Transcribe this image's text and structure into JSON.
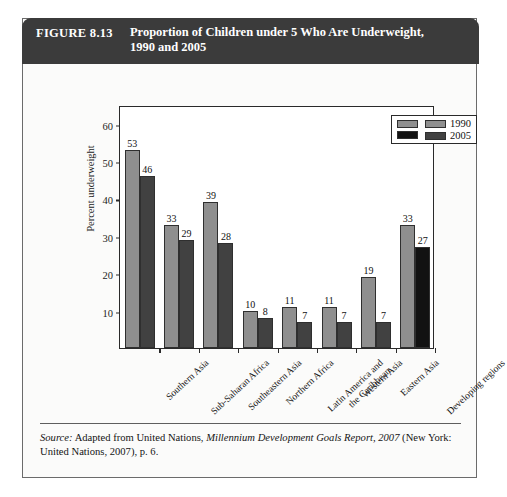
{
  "figure": {
    "number": "FIGURE 8.13",
    "title_line1": "Proportion of Children under 5 Who Are Underweight,",
    "title_line2": "1990 and 2005"
  },
  "source": {
    "label": "Source:",
    "text_before": " Adapted from United Nations, ",
    "publication": "Millennium Development Goals Report, 2007",
    "text_after": " (New York: United Nations, 2007), p. 6."
  },
  "legend": {
    "items": [
      {
        "label": "1990",
        "color": "#8f8f8f"
      },
      {
        "label": "2005",
        "color": "#414141"
      }
    ],
    "extra_swatches": [
      {
        "name": "developing-1990",
        "color": "#8f8f8f"
      },
      {
        "name": "developing-2005",
        "color": "#121212"
      }
    ]
  },
  "chart_data": {
    "type": "bar",
    "title": "Proportion of Children under 5 Who Are Underweight, 1990 and 2005",
    "xlabel": "",
    "ylabel": "Percent underweight",
    "ylim": [
      0,
      65
    ],
    "yticks": [
      10,
      20,
      30,
      40,
      50,
      60
    ],
    "grid": false,
    "legend_position": "top-right",
    "categories": [
      "Southern Asia",
      "Sub-Saharan Africa",
      "Southeastern Asia",
      "Northern Africa",
      "Latin America and the Caribbean",
      "Western Asia",
      "Eastern Asia",
      "Developing regions"
    ],
    "category_lines": [
      [
        "Southern Asia"
      ],
      [
        "Sub-Saharan Africa"
      ],
      [
        "Southeastern Asia"
      ],
      [
        "Northern Africa"
      ],
      [
        "Latin America and",
        "the Caribbean"
      ],
      [
        "Western Asia"
      ],
      [
        "Eastern Asia"
      ],
      [
        "Developing regions"
      ]
    ],
    "series": [
      {
        "name": "1990",
        "color": "#8f8f8f",
        "values": [
          53,
          33,
          39,
          10,
          11,
          11,
          19,
          33
        ]
      },
      {
        "name": "2005",
        "color": "#414141",
        "values": [
          46,
          29,
          28,
          8,
          7,
          7,
          7,
          27
        ]
      }
    ],
    "highlight": {
      "category": "Developing regions",
      "series": "2005",
      "color": "#121212"
    }
  }
}
